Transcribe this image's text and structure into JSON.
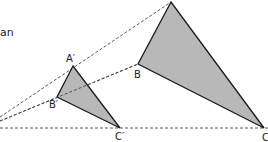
{
  "text_fragment": "an",
  "fill_color": "#b8b8b8",
  "stroke_color": "#1a1a1a",
  "dash_color": "#444444",
  "labels": {
    "A_prime": "A′",
    "B_prime": "B′",
    "C_prime": "C′",
    "B": "B",
    "C": "C"
  }
}
